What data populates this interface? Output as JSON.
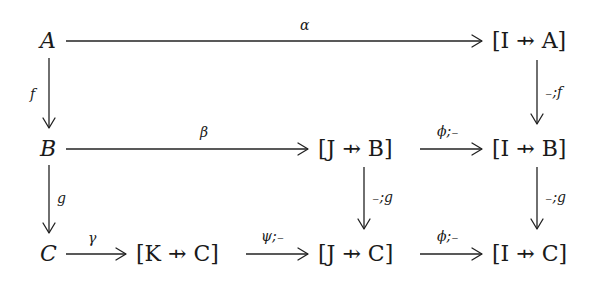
{
  "diagram": {
    "type": "commutative-diagram",
    "nodes": [
      {
        "id": "A",
        "label": "A",
        "row": 0,
        "col": 0
      },
      {
        "id": "IA",
        "label": "[I ⇸ A]",
        "row": 0,
        "col": 3
      },
      {
        "id": "B",
        "label": "B",
        "row": 1,
        "col": 0
      },
      {
        "id": "JB",
        "label": "[J ⇸ B]",
        "row": 1,
        "col": 2
      },
      {
        "id": "IB",
        "label": "[I ⇸ B]",
        "row": 1,
        "col": 3
      },
      {
        "id": "C",
        "label": "C",
        "row": 2,
        "col": 0
      },
      {
        "id": "KC",
        "label": "[K ⇸ C]",
        "row": 2,
        "col": 1
      },
      {
        "id": "JC",
        "label": "[J ⇸ C]",
        "row": 2,
        "col": 2
      },
      {
        "id": "IC",
        "label": "[I ⇸ C]",
        "row": 2,
        "col": 3
      }
    ],
    "edges": [
      {
        "from": "A",
        "to": "IA",
        "label": "α"
      },
      {
        "from": "A",
        "to": "B",
        "label": "f"
      },
      {
        "from": "IA",
        "to": "IB",
        "label": "₋;f"
      },
      {
        "from": "B",
        "to": "JB",
        "label": "β"
      },
      {
        "from": "JB",
        "to": "IB",
        "label": "ϕ;₋"
      },
      {
        "from": "B",
        "to": "C",
        "label": "g"
      },
      {
        "from": "JB",
        "to": "JC",
        "label": "₋;g"
      },
      {
        "from": "IB",
        "to": "IC",
        "label": "₋;g"
      },
      {
        "from": "C",
        "to": "KC",
        "label": "γ"
      },
      {
        "from": "KC",
        "to": "JC",
        "label": "ψ;₋"
      },
      {
        "from": "JC",
        "to": "IC",
        "label": "ϕ;₋"
      }
    ]
  },
  "labels": {
    "A": "A",
    "B": "B",
    "C": "C",
    "IA": "[I ⇸ A]",
    "JB": "[J ⇸ B]",
    "IB": "[I ⇸ B]",
    "KC": "[K ⇸ C]",
    "JC": "[J ⇸ C]",
    "IC": "[I ⇸ C]",
    "alpha": "α",
    "beta": "β",
    "gamma": "γ",
    "f": "f",
    "g": "g",
    "pre_f": "₋;f",
    "pre_g_mid": "₋;g",
    "pre_g_right": "₋;g",
    "phi_semi_top": "ϕ;₋",
    "phi_semi_bottom": "ϕ;₋",
    "psi_semi": "ψ;₋"
  }
}
